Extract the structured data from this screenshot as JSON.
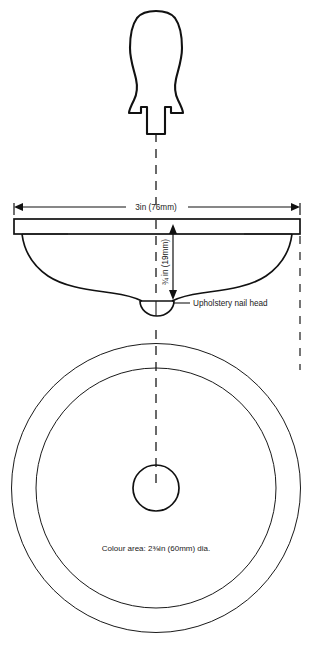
{
  "diagram": {
    "line_color": "#1a1a1a",
    "background_color": "#ffffff",
    "views": {
      "tool": {
        "name": "awl-tool-outline"
      },
      "section": {
        "name": "cross-section-profile"
      },
      "plan": {
        "name": "plan-view-concentric-circles"
      }
    },
    "dimensions": {
      "width_label": "3in (76mm)",
      "depth_label": "¾ in (19mm)",
      "depth_label_plain": "3/4in (19mm)"
    },
    "callouts": {
      "nail_head": "Upholstery nail head"
    },
    "annotations": {
      "colour_area": "Colour area: 2⅜in (60mm) dia."
    }
  }
}
